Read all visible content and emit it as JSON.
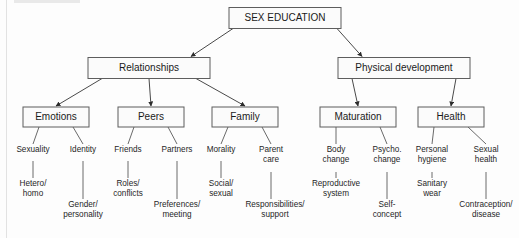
{
  "diagram": {
    "type": "hierarchical-tree",
    "title_box": "SEX EDUCATION",
    "colors": {
      "background": "#fdfdfd",
      "box_fill": "#fbfbfb",
      "box_stroke": "#5d5d5d",
      "connector": "#4a4a4a",
      "text": "#1a1a1a"
    },
    "root": {
      "label": "SEX EDUCATION",
      "x": 285,
      "y": 18,
      "w": 112,
      "h": 21
    },
    "level2": [
      {
        "label": "Relationships",
        "x": 149,
        "y": 68,
        "w": 122,
        "h": 21
      },
      {
        "label": "Physical development",
        "x": 404,
        "y": 68,
        "w": 132,
        "h": 21
      }
    ],
    "level3": [
      {
        "label": "Emotions",
        "x": 56,
        "y": 117,
        "w": 66,
        "h": 20,
        "parent": 0
      },
      {
        "label": "Peers",
        "x": 151,
        "y": 117,
        "w": 66,
        "h": 20,
        "parent": 0
      },
      {
        "label": "Family",
        "x": 245,
        "y": 117,
        "w": 66,
        "h": 20,
        "parent": 0
      },
      {
        "label": "Maturation",
        "x": 358,
        "y": 117,
        "w": 76,
        "h": 20,
        "parent": 1
      },
      {
        "label": "Health",
        "x": 451,
        "y": 117,
        "w": 66,
        "h": 20,
        "parent": 1
      }
    ],
    "level4": [
      {
        "lines": [
          "Sexuality"
        ],
        "x": 33,
        "y": 152,
        "parent": 0,
        "side": "left"
      },
      {
        "lines": [
          "Identity"
        ],
        "x": 83,
        "y": 152,
        "parent": 0,
        "side": "right"
      },
      {
        "lines": [
          "Friends"
        ],
        "x": 128,
        "y": 152,
        "parent": 1,
        "side": "left"
      },
      {
        "lines": [
          "Partners"
        ],
        "x": 177,
        "y": 152,
        "parent": 1,
        "side": "right"
      },
      {
        "lines": [
          "Morality"
        ],
        "x": 221,
        "y": 152,
        "parent": 2,
        "side": "left"
      },
      {
        "lines": [
          "Parent",
          "care"
        ],
        "x": 271,
        "y": 152,
        "parent": 2,
        "side": "right"
      },
      {
        "lines": [
          "Body",
          "change"
        ],
        "x": 336,
        "y": 152,
        "parent": 3,
        "side": "left"
      },
      {
        "lines": [
          "Psycho.",
          "change"
        ],
        "x": 387,
        "y": 152,
        "parent": 3,
        "side": "right"
      },
      {
        "lines": [
          "Personal",
          "hygiene"
        ],
        "x": 432,
        "y": 152,
        "parent": 4,
        "side": "left"
      },
      {
        "lines": [
          "Sexual",
          "health"
        ],
        "x": 486,
        "y": 152,
        "parent": 4,
        "side": "right"
      }
    ],
    "level5": [
      {
        "lines": [
          "Hetero/",
          "homo"
        ],
        "x": 33,
        "y": 186,
        "parent": 0,
        "stem_from": 161,
        "stem_to": 178
      },
      {
        "lines": [
          "Gender/",
          "personality"
        ],
        "x": 83,
        "y": 207,
        "parent": 1,
        "stem_from": 161,
        "stem_to": 199
      },
      {
        "lines": [
          "Roles/",
          "conflicts"
        ],
        "x": 128,
        "y": 186,
        "parent": 2,
        "stem_from": 161,
        "stem_to": 178
      },
      {
        "lines": [
          "Preferences/",
          "meeting"
        ],
        "x": 177,
        "y": 207,
        "parent": 3,
        "stem_from": 161,
        "stem_to": 199
      },
      {
        "lines": [
          "Social/",
          "sexual"
        ],
        "x": 221,
        "y": 186,
        "parent": 4,
        "stem_from": 161,
        "stem_to": 178
      },
      {
        "lines": [
          "Responsibilities/",
          "support"
        ],
        "x": 275,
        "y": 207,
        "parent": 5,
        "stem_from": 172,
        "stem_to": 199
      },
      {
        "lines": [
          "Reproductive",
          "system"
        ],
        "x": 336,
        "y": 186,
        "parent": 6,
        "stem_from": 172,
        "stem_to": 178
      },
      {
        "lines": [
          "Self-",
          "concept"
        ],
        "x": 387,
        "y": 207,
        "parent": 7,
        "stem_from": 172,
        "stem_to": 199
      },
      {
        "lines": [
          "Sanitary",
          "wear"
        ],
        "x": 432,
        "y": 186,
        "parent": 8,
        "stem_from": 172,
        "stem_to": 178
      },
      {
        "lines": [
          "Contraception/",
          "disease"
        ],
        "x": 486,
        "y": 207,
        "parent": 9,
        "stem_from": 172,
        "stem_to": 199
      }
    ]
  }
}
